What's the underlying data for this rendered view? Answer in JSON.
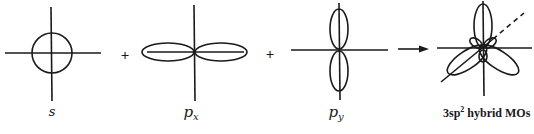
{
  "diagram": {
    "stroke_color": "#1a1a1a",
    "background": "#ffffff",
    "orbitals": [
      {
        "id": "s",
        "label": "s",
        "subscript": "",
        "shape": "sphere"
      },
      {
        "id": "px",
        "label": "p",
        "subscript": "x",
        "shape": "dumbbell-horizontal"
      },
      {
        "id": "py",
        "label": "p",
        "subscript": "y",
        "shape": "dumbbell-vertical"
      },
      {
        "id": "hybrid",
        "label_prefix": "3sp",
        "label_sup": "2",
        "label_suffix": " hybrid MOs",
        "shape": "three-lobed-trigonal"
      }
    ],
    "operators": [
      "+",
      "+"
    ],
    "arrow": "yields-arrow"
  }
}
